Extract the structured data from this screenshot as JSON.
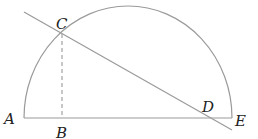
{
  "diagram": {
    "type": "geometry",
    "points": {
      "A": {
        "label": "A",
        "x": 24,
        "y": 118
      },
      "B": {
        "label": "B",
        "x": 62,
        "y": 118
      },
      "C": {
        "label": "C",
        "x": 62,
        "y": 34
      },
      "D": {
        "label": "D",
        "x": 208,
        "y": 118
      },
      "E": {
        "label": "E",
        "x": 232,
        "y": 118
      }
    },
    "labels": {
      "A": "A",
      "B": "B",
      "C": "C",
      "D": "D",
      "E": "E"
    },
    "colors": {
      "stroke": "#9a9a9a",
      "text": "#222222"
    }
  }
}
